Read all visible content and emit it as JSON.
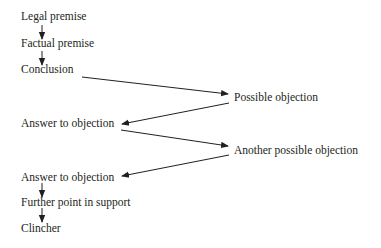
{
  "diagram": {
    "type": "argument-flow",
    "nodes": [
      {
        "id": "legal",
        "label": "Legal premise"
      },
      {
        "id": "factual",
        "label": "Factual premise"
      },
      {
        "id": "conclusion",
        "label": "Conclusion"
      },
      {
        "id": "objection1",
        "label": "Possible objection"
      },
      {
        "id": "answer1",
        "label": "Answer to objection"
      },
      {
        "id": "objection2",
        "label": "Another possible objection"
      },
      {
        "id": "answer2",
        "label": "Answer to objection"
      },
      {
        "id": "further",
        "label": "Further point in support"
      },
      {
        "id": "clincher",
        "label": "Clincher"
      }
    ],
    "edges": [
      {
        "from": "legal",
        "to": "factual"
      },
      {
        "from": "factual",
        "to": "conclusion"
      },
      {
        "from": "conclusion",
        "to": "objection1"
      },
      {
        "from": "objection1",
        "to": "answer1"
      },
      {
        "from": "answer1",
        "to": "objection2"
      },
      {
        "from": "objection2",
        "to": "answer2"
      },
      {
        "from": "answer2",
        "to": "further"
      },
      {
        "from": "further",
        "to": "clincher"
      }
    ],
    "colors": {
      "text": "#231f20",
      "line": "#231f20",
      "background": "#ffffff"
    }
  }
}
